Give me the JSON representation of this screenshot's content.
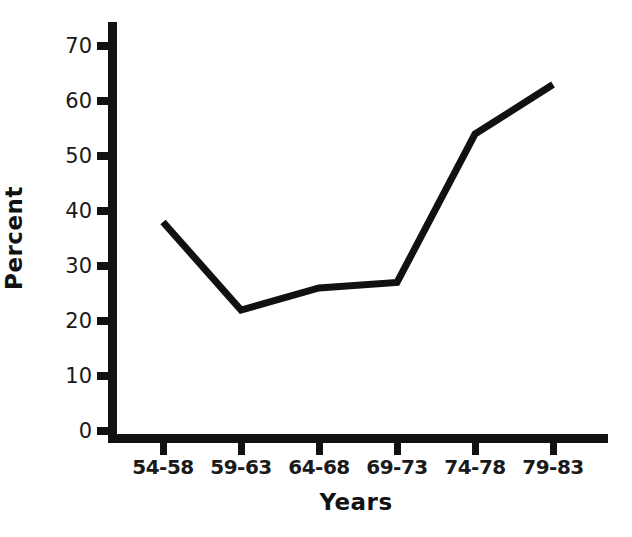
{
  "chart_data": {
    "type": "line",
    "title": "",
    "subtitle": "",
    "xlabel": "Years",
    "ylabel": "Percent",
    "categories": [
      "54-58",
      "59-63",
      "64-68",
      "69-73",
      "74-78",
      "79-83"
    ],
    "values": [
      38,
      22,
      26,
      27,
      54,
      63
    ],
    "series": [
      {
        "name": "Percent",
        "values": [
          38,
          22,
          26,
          27,
          54,
          63
        ]
      }
    ],
    "ylim": [
      0,
      73
    ],
    "yticks": [
      0,
      10,
      20,
      30,
      40,
      50,
      60,
      70
    ],
    "ytick_labels": [
      "0",
      "10",
      "20",
      "30",
      "40",
      "50",
      "60",
      "70"
    ],
    "xtick_labels": [
      "54-58",
      "59-63",
      "64-68",
      "69-73",
      "74-78",
      "79-83"
    ],
    "grid": false,
    "legend": false,
    "legend_position": "none",
    "annotations": [],
    "line_color": "#111111",
    "axis_color": "#111111",
    "background_color": "#ffffff"
  },
  "axes": {
    "y_title": "Percent",
    "x_title": "Years"
  }
}
